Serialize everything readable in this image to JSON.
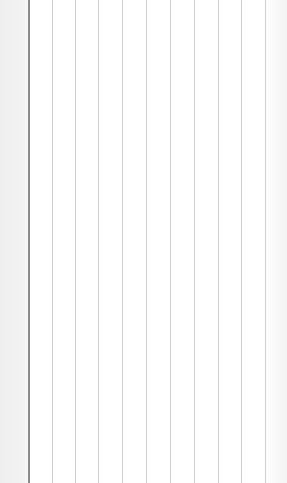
{
  "canvas": {
    "width": 287,
    "height": 483,
    "background": "#ffffff",
    "left_margin_color": "#efefef",
    "right_edge_color": "#f4f4f4"
  },
  "lines": [
    {
      "x": 28,
      "color": "#8a8a8a",
      "width": 2
    },
    {
      "x": 52,
      "color": "#cfcfcf",
      "width": 1
    },
    {
      "x": 75,
      "color": "#cfcfcf",
      "width": 1
    },
    {
      "x": 98,
      "color": "#cfcfcf",
      "width": 1
    },
    {
      "x": 122,
      "color": "#cfcfcf",
      "width": 1
    },
    {
      "x": 146,
      "color": "#cfcfcf",
      "width": 1
    },
    {
      "x": 170,
      "color": "#cfcfcf",
      "width": 1
    },
    {
      "x": 194,
      "color": "#cfcfcf",
      "width": 1
    },
    {
      "x": 218,
      "color": "#cfcfcf",
      "width": 1
    },
    {
      "x": 241,
      "color": "#cfcfcf",
      "width": 1
    },
    {
      "x": 265,
      "color": "#cfcfcf",
      "width": 1
    }
  ]
}
